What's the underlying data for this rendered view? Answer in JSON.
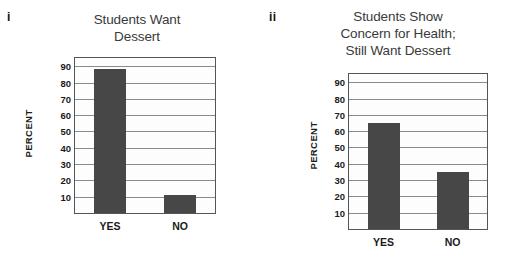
{
  "figure": {
    "background": "#ffffff",
    "bar_color": "#474747",
    "axis_color": "#555555",
    "grid_color": "#8a8a8a",
    "panels": [
      {
        "tag": "i",
        "title_lines": [
          "Students Want",
          "Dessert"
        ],
        "y_caption": "PERCENT",
        "categories": [
          "YES",
          "NO"
        ],
        "values": [
          88,
          11
        ]
      },
      {
        "tag": "ii",
        "title_lines": [
          "Students Show",
          "Concern for Health;",
          "Still Want Dessert"
        ],
        "y_caption": "PERCENT",
        "categories": [
          "YES",
          "NO"
        ],
        "values": [
          65,
          35
        ]
      }
    ],
    "y_ticks": [
      "90",
      "80",
      "70",
      "60",
      "50",
      "40",
      "30",
      "20",
      "10"
    ]
  },
  "chart_data": [
    {
      "type": "bar",
      "panel": "i",
      "title": "Students Want Dessert",
      "categories": [
        "YES",
        "NO"
      ],
      "values": [
        88,
        11
      ],
      "xlabel": "",
      "ylabel": "PERCENT",
      "ylim": [
        0,
        95
      ],
      "yticks": [
        10,
        20,
        30,
        40,
        50,
        60,
        70,
        80,
        90
      ],
      "grid": true,
      "legend": "none"
    },
    {
      "type": "bar",
      "panel": "ii",
      "title": "Students Show Concern for Health; Still Want Dessert",
      "categories": [
        "YES",
        "NO"
      ],
      "values": [
        65,
        35
      ],
      "xlabel": "",
      "ylabel": "PERCENT",
      "ylim": [
        0,
        95
      ],
      "yticks": [
        10,
        20,
        30,
        40,
        50,
        60,
        70,
        80,
        90
      ],
      "grid": true,
      "legend": "none"
    }
  ]
}
